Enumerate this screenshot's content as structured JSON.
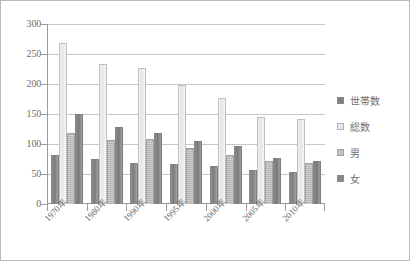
{
  "chart_data": {
    "type": "bar",
    "title": "",
    "subtitle": "",
    "xlabel": "",
    "ylabel": "",
    "ylim": [
      0,
      300
    ],
    "ytick_step": 50,
    "yticks": [
      300,
      250,
      200,
      150,
      100,
      50,
      0
    ],
    "grid": true,
    "legend_position": "right",
    "categories": [
      "1970年",
      "1980年",
      "1990年",
      "1995年",
      "2000年",
      "2005年",
      "2010年"
    ],
    "series": [
      {
        "name": "世帯数",
        "color": "#808080",
        "values": [
          81,
          75,
          69,
          67,
          64,
          56,
          53
        ]
      },
      {
        "name": "総数",
        "color": "#e9e9e9",
        "values": [
          268,
          233,
          227,
          198,
          177,
          145,
          141
        ]
      },
      {
        "name": "男",
        "color": "#c2c2c2",
        "values": [
          119,
          106,
          108,
          94,
          82,
          72,
          69
        ]
      },
      {
        "name": "女",
        "color": "#888888",
        "values": [
          150,
          128,
          119,
          105,
          96,
          76,
          72
        ]
      }
    ]
  },
  "legend": {
    "items": [
      {
        "label": "世帯数"
      },
      {
        "label": "総数"
      },
      {
        "label": "男"
      },
      {
        "label": "女"
      }
    ]
  }
}
